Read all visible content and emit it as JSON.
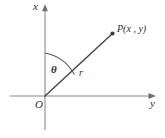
{
  "figure": {
    "kind": "polar-coordinate-diagram",
    "background_color": "#ffffff",
    "ink_color": "#2f2f2f",
    "axis_color": "#8a8a8a",
    "ray_color": "#4a4a4a",
    "labels": {
      "vertical_axis": "x",
      "horizontal_axis": "y",
      "origin": "O",
      "angle": "θ",
      "radius": "r",
      "point": "P(x , y)"
    },
    "geometry": {
      "origin_px": [
        45,
        96
      ],
      "point_p_px": [
        112,
        33
      ],
      "vertical_axis_from_px": [
        45,
        130
      ],
      "vertical_axis_to_px": [
        45,
        6
      ],
      "horizontal_axis_from_px": [
        10,
        96
      ],
      "horizontal_axis_to_px": [
        156,
        96
      ],
      "angle_arc_start_px": [
        45,
        53
      ],
      "angle_arc_end_px": [
        74,
        75
      ],
      "angle_arc_radius_px": 43
    }
  }
}
